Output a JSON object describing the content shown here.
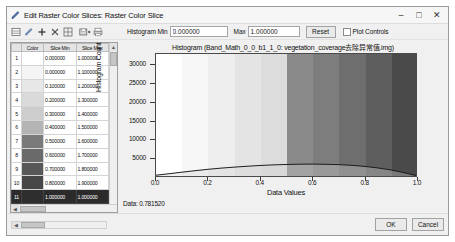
{
  "window": {
    "title": "Edit Raster Color Slices: Raster Color Slice",
    "title_icon": "pencil-icon",
    "minimize_label": "–",
    "maximize_label": "□",
    "close_label": "✕"
  },
  "toolbar": {
    "icons": [
      {
        "name": "new-slices-icon",
        "glyph": "▤"
      },
      {
        "name": "edit-slices-icon",
        "glyph": "✎"
      },
      {
        "name": "add-slice-icon",
        "glyph": "✚"
      },
      {
        "name": "delete-slice-icon",
        "glyph": "✗"
      },
      {
        "name": "grid-slices-icon",
        "glyph": "▒"
      },
      {
        "name": "save-slices-icon",
        "glyph": "▥"
      },
      {
        "name": "print-slices-icon",
        "glyph": "⎙"
      }
    ],
    "histogram_min_label": "Histogram Min",
    "histogram_min_value": "0.000000",
    "histogram_max_label": "Max",
    "histogram_max_value": "1.000000",
    "reset_label": "Reset",
    "plot_controls_label": "Plot Controls",
    "plot_controls_checked": false
  },
  "table": {
    "columns": [
      "",
      "Color",
      "Slice Min",
      "Slice Max"
    ],
    "rows": [
      {
        "index": "1",
        "color": "#ffffff",
        "min": "0.000000",
        "max": "1.000000",
        "selected": false
      },
      {
        "index": "2",
        "color": "#f4f4f4",
        "min": "0.000000",
        "max": "1.100000",
        "selected": false
      },
      {
        "index": "3",
        "color": "#e7e7e7",
        "min": "0.100000",
        "max": "1.200000",
        "selected": false
      },
      {
        "index": "4",
        "color": "#dadada",
        "min": "0.200000",
        "max": "1.300000",
        "selected": false
      },
      {
        "index": "5",
        "color": "#cdcdcd",
        "min": "0.300000",
        "max": "1.400000",
        "selected": false
      },
      {
        "index": "6",
        "color": "#b4b4b4",
        "min": "0.400000",
        "max": "1.500000",
        "selected": false
      },
      {
        "index": "7",
        "color": "#7a7a7a",
        "min": "0.500000",
        "max": "1.600000",
        "selected": false
      },
      {
        "index": "8",
        "color": "#6a6a6a",
        "min": "0.600000",
        "max": "1.700000",
        "selected": false
      },
      {
        "index": "9",
        "color": "#585858",
        "min": "0.700000",
        "max": "1.800000",
        "selected": false
      },
      {
        "index": "10",
        "color": "#464646",
        "min": "0.800000",
        "max": "1.900000",
        "selected": false
      },
      {
        "index": "11",
        "color": "#2e2e2e",
        "min": "1.000000",
        "max": "1.000000",
        "selected": true
      }
    ],
    "scroll_up_glyph": "▲",
    "scroll_down_glyph": "▼",
    "scroll_left_glyph": "◀",
    "scroll_right_glyph": "▶"
  },
  "chart_data": {
    "type": "area",
    "title": "Histogram (Band_Math_0_0_b1_1_0: vegetation_coverage去除异常值.img)",
    "xlabel": "Data Values",
    "ylabel": "Histogram Count",
    "xlim": [
      0.0,
      1.0
    ],
    "ylim": [
      0,
      33000
    ],
    "xticks": [
      "0.0",
      "0.2",
      "0.4",
      "0.6",
      "0.8",
      "1.0"
    ],
    "xtick_values": [
      0.0,
      0.2,
      0.4,
      0.6,
      0.8,
      1.0
    ],
    "yticks": [
      "5000",
      "10000",
      "15000",
      "20000",
      "25000",
      "30000"
    ],
    "ytick_values": [
      5000,
      10000,
      15000,
      20000,
      25000,
      30000
    ],
    "grid": false,
    "legend": "none",
    "x": [
      0.0,
      0.05,
      0.1,
      0.15,
      0.2,
      0.25,
      0.3,
      0.35,
      0.4,
      0.45,
      0.5,
      0.55,
      0.6,
      0.65,
      0.7,
      0.75,
      0.8,
      0.85,
      0.9,
      0.95,
      1.0
    ],
    "values": [
      200,
      620,
      1050,
      1450,
      1800,
      2120,
      2400,
      2640,
      2840,
      3000,
      3120,
      3200,
      3220,
      3180,
      3080,
      2900,
      2620,
      2220,
      1680,
      950,
      120
    ],
    "color_slice_bands": [
      {
        "from": 0.0,
        "to": 0.1,
        "color": "#ffffff"
      },
      {
        "from": 0.1,
        "to": 0.2,
        "color": "#f7f7f7"
      },
      {
        "from": 0.2,
        "to": 0.3,
        "color": "#eeeeee"
      },
      {
        "from": 0.3,
        "to": 0.4,
        "color": "#e4e4e4"
      },
      {
        "from": 0.4,
        "to": 0.5,
        "color": "#dcdcdc"
      },
      {
        "from": 0.5,
        "to": 0.6,
        "color": "#8a8a8a"
      },
      {
        "from": 0.6,
        "to": 0.7,
        "color": "#7d7d7d"
      },
      {
        "from": 0.7,
        "to": 0.8,
        "color": "#6e6e6e"
      },
      {
        "from": 0.8,
        "to": 0.9,
        "color": "#5e5e5e"
      },
      {
        "from": 0.9,
        "to": 1.0,
        "color": "#4a4a4a"
      }
    ]
  },
  "status": {
    "data_readout": "Data: 0.781520"
  },
  "footer": {
    "ok_label": "OK",
    "cancel_label": "Cancel",
    "scroll_left_glyph": "◀",
    "scroll_right_glyph": "▶"
  }
}
